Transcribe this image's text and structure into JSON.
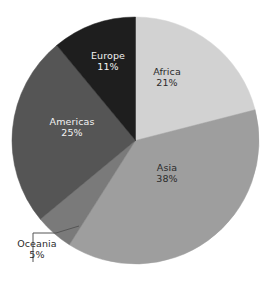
{
  "chart_data": {
    "type": "pie",
    "title": "",
    "subtitle": "",
    "xlabel": "",
    "ylabel": "",
    "legend": "none",
    "grid": false,
    "value_suffix": "%",
    "start_angle_deg": 0,
    "direction": "clockwise",
    "categories": [
      "Africa",
      "Asia",
      "Oceania",
      "Americas",
      "Europe"
    ],
    "values": [
      21,
      38,
      5,
      25,
      11
    ],
    "slices": [
      {
        "label": "Africa",
        "value": 21,
        "value_text": "21%",
        "color": "#d2d2d2",
        "label_color": "#2b2b2b",
        "label_position": "inside"
      },
      {
        "label": "Asia",
        "value": 38,
        "value_text": "38%",
        "color": "#9e9e9e",
        "label_color": "#2b2b2b",
        "label_position": "inside"
      },
      {
        "label": "Oceania",
        "value": 5,
        "value_text": "5%",
        "color": "#7a7a7a",
        "label_color": "#2b2b2b",
        "label_position": "outside"
      },
      {
        "label": "Americas",
        "value": 25,
        "value_text": "25%",
        "color": "#555555",
        "label_color": "#f2f2f2",
        "label_position": "inside"
      },
      {
        "label": "Europe",
        "value": 11,
        "value_text": "11%",
        "color": "#1e1e1e",
        "label_color": "#f2f2f2",
        "label_position": "inside"
      }
    ],
    "background_color": "#ffffff",
    "leader_line_color": "#555555"
  }
}
